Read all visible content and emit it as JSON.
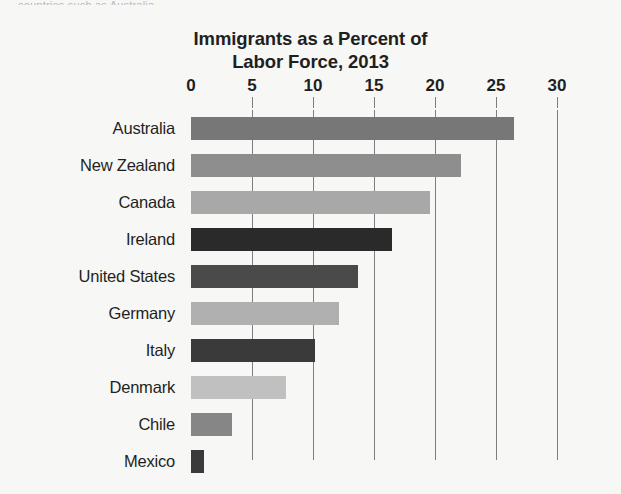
{
  "clipped_caption": "countries such as Australia",
  "chart_data": {
    "type": "bar",
    "orientation": "horizontal",
    "title": "Immigrants as a Percent of Labor Force, 2013",
    "title_line1": "Immigrants as a Percent of",
    "title_line2": "Labor Force, 2013",
    "xlabel": "",
    "ylabel": "",
    "xlim": [
      0,
      30
    ],
    "xticks": [
      0,
      5,
      10,
      15,
      20,
      25,
      30
    ],
    "xtick_labels": [
      "0",
      "5",
      "10",
      "15",
      "20",
      "25",
      "30"
    ],
    "grid": "vertical",
    "legend": "none",
    "categories": [
      "Australia",
      "New Zealand",
      "Canada",
      "Ireland",
      "United States",
      "Germany",
      "Italy",
      "Denmark",
      "Chile",
      "Mexico"
    ],
    "values": [
      26.5,
      22.1,
      19.6,
      16.5,
      13.7,
      12.1,
      10.2,
      7.8,
      3.4,
      1.1
    ],
    "bar_colors": [
      "#777777",
      "#8e8e8e",
      "#a8a8a8",
      "#2a2a2a",
      "#4a4a4a",
      "#b0b0b0",
      "#3a3a3a",
      "#c0c0c0",
      "#868686",
      "#3a3a3a"
    ],
    "axis_color": "#7e7e7e",
    "background_color": "#f7f7f5",
    "text_color": "#1f1f1f"
  }
}
